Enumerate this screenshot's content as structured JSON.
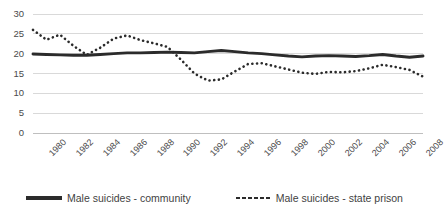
{
  "chart_data": {
    "type": "line",
    "title": "",
    "xlabel": "",
    "ylabel": "",
    "ylim": [
      0,
      30
    ],
    "yticks": [
      0,
      5,
      10,
      15,
      20,
      25,
      30
    ],
    "grid": true,
    "legend_position": "bottom",
    "x": [
      1980,
      1981,
      1982,
      1983,
      1984,
      1985,
      1986,
      1987,
      1988,
      1989,
      1990,
      1991,
      1992,
      1993,
      1994,
      1995,
      1996,
      1997,
      1998,
      1999,
      2000,
      2001,
      2002,
      2003,
      2004,
      2005,
      2006,
      2007,
      2008,
      2009
    ],
    "xtick_labels": [
      "1980",
      "1982",
      "1984",
      "1986",
      "1988",
      "1990",
      "1992",
      "1994",
      "1996",
      "1998",
      "2000",
      "2002",
      "2004",
      "2006",
      "2008"
    ],
    "series": [
      {
        "name": "Male suicides - community",
        "style": "solid",
        "color": "#2b2b2b",
        "values": [
          19.9,
          19.8,
          19.7,
          19.6,
          19.6,
          19.8,
          20.0,
          20.2,
          20.2,
          20.3,
          20.4,
          20.3,
          20.2,
          20.5,
          20.8,
          20.5,
          20.2,
          20.0,
          19.7,
          19.4,
          19.2,
          19.4,
          19.5,
          19.4,
          19.3,
          19.5,
          19.8,
          19.4,
          19.1,
          19.4
        ]
      },
      {
        "name": "Male suicides - state prison",
        "style": "dotted",
        "color": "#2b2b2b",
        "values": [
          26.0,
          23.5,
          24.8,
          22.0,
          19.7,
          21.5,
          23.8,
          24.6,
          23.4,
          22.6,
          21.7,
          18.5,
          15.0,
          13.2,
          13.5,
          15.5,
          17.4,
          17.6,
          16.8,
          16.0,
          15.2,
          14.9,
          15.4,
          15.3,
          15.6,
          16.3,
          17.2,
          16.6,
          15.9,
          14.2
        ]
      }
    ]
  },
  "legend": {
    "entries": [
      {
        "label": "Male suicides - community",
        "marker": "solid-line-swatch"
      },
      {
        "label": "Male suicides - state prison",
        "marker": "dotted-line-swatch"
      }
    ]
  }
}
